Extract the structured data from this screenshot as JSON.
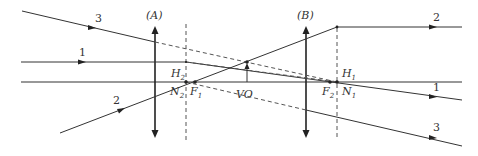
{
  "diagram": {
    "title": "",
    "lenses": [
      {
        "id": "A",
        "label": "(A)",
        "x": 155
      },
      {
        "id": "B",
        "label": "(B)",
        "x": 306
      }
    ],
    "principal_planes": [
      {
        "x": 186,
        "top_label": "H",
        "top_sub": "2",
        "bottom_label": "N",
        "bottom_sub": "2"
      },
      {
        "x": 337,
        "top_label": "H",
        "top_sub": "1",
        "bottom_label": "N",
        "bottom_sub": "1"
      }
    ],
    "points": {
      "F1": {
        "label": "F",
        "sub": "1"
      },
      "F2": {
        "label": "F",
        "sub": "2"
      },
      "VO": {
        "label": "VO"
      }
    },
    "rays": [
      {
        "id": "1",
        "label": "1"
      },
      {
        "id": "2",
        "label": "2"
      },
      {
        "id": "3",
        "label": "3"
      }
    ],
    "ray_labels_out": {
      "ray1": "1",
      "ray2": "2",
      "ray3": "3"
    }
  }
}
